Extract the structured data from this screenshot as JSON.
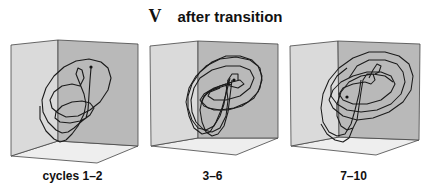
{
  "figure": {
    "panel_letter": "V",
    "title": "after transition",
    "colors": {
      "left_wall": "#dadada",
      "back_wall": "#b9b9b9",
      "floor": "#eeeeee",
      "edge": "#444444",
      "trajectory": "#1a1a1a"
    },
    "panels": [
      {
        "label": "cycles 1–2",
        "offset_x": 0,
        "center_x": 69
      },
      {
        "label": "3–6",
        "offset_x": 140,
        "center_x": 76
      },
      {
        "label": "7–10",
        "offset_x": 281,
        "center_x": 68
      }
    ]
  }
}
